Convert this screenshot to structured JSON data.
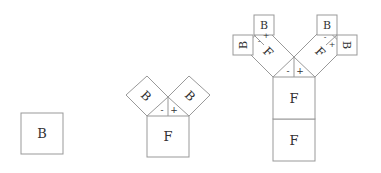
{
  "figures": [
    {
      "name": "single-block",
      "labels": {
        "b": "B"
      }
    },
    {
      "name": "one-split",
      "labels": {
        "f": "F",
        "b_left": "B",
        "b_right": "B",
        "minus": "-",
        "plus": "+"
      }
    },
    {
      "name": "two-level-split",
      "labels": {
        "f_top": "F",
        "f_bottom": "F",
        "f_left": "F",
        "f_right": "F",
        "b1": "B",
        "b2": "B",
        "b3": "B",
        "b4": "B",
        "minus": "-",
        "plus": "+"
      }
    }
  ]
}
